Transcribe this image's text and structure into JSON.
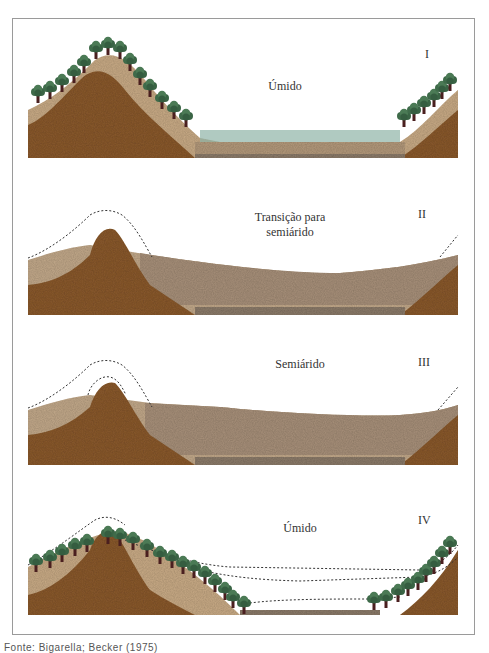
{
  "figure": {
    "panels": [
      {
        "numeral": "I",
        "label": "Úmido"
      },
      {
        "numeral": "II",
        "label": "Transição para semiárido",
        "label_line1": "Transição para",
        "label_line2": "semiárido"
      },
      {
        "numeral": "III",
        "label": "Semiárido"
      },
      {
        "numeral": "IV",
        "label": "Úmido"
      }
    ],
    "source": "Fonte: Bigarella; Becker (1975)",
    "colors": {
      "bedrock": "#8a5a2e",
      "regolith": "#c9ab86",
      "sediment": "#a8917a",
      "vegetation": "#3f6b4a",
      "trunk": "#4a1f1f",
      "grass": "#8fb3a6",
      "dashed_line": "#333333"
    }
  }
}
